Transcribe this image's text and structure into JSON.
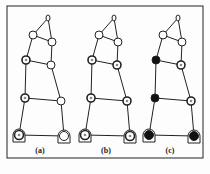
{
  "figure": {
    "colors": {
      "line": "#222222",
      "background": "#fdfdfd",
      "filled": "#111111"
    },
    "panels": [
      {
        "label": "(a)",
        "offset_x": 0,
        "nodes": {
          "tip": "open",
          "tri_l": "open",
          "tri_r": "open",
          "mid_l": "double",
          "mid_r": "open",
          "low_l": "double",
          "low_r": "open",
          "base_l": "double",
          "base_r": "open"
        }
      },
      {
        "label": "(b)",
        "offset_x": 66,
        "nodes": {
          "tip": "open",
          "tri_l": "open",
          "tri_r": "open",
          "mid_l": "double",
          "mid_r": "double",
          "low_l": "double",
          "low_r": "double",
          "base_l": "double",
          "base_r": "double"
        }
      },
      {
        "label": "(c)",
        "offset_x": 130,
        "nodes": {
          "tip": "open",
          "tri_l": "open",
          "tri_r": "open",
          "mid_l": "filled",
          "mid_r": "double",
          "low_l": "filled",
          "low_r": "double",
          "base_l": "filled",
          "base_r": "filled"
        }
      }
    ]
  }
}
